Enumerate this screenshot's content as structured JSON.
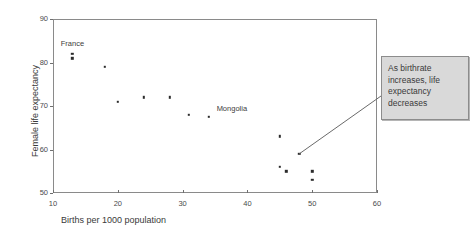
{
  "chart_data": {
    "type": "scatter",
    "title": "",
    "xlabel": "Births per 1000 population",
    "ylabel": "Female life expectancy",
    "xlim": [
      10,
      60
    ],
    "ylim": [
      50,
      90
    ],
    "xticks": [
      10,
      20,
      30,
      40,
      50,
      60
    ],
    "yticks": [
      50,
      60,
      70,
      80,
      90
    ],
    "grid": false,
    "legend": null,
    "series": [
      {
        "name": "countries",
        "points": [
          {
            "x": 13,
            "y": 82
          },
          {
            "x": 13,
            "y": 81
          },
          {
            "x": 18,
            "y": 79
          },
          {
            "x": 20,
            "y": 71
          },
          {
            "x": 24,
            "y": 72
          },
          {
            "x": 28,
            "y": 72
          },
          {
            "x": 31,
            "y": 68
          },
          {
            "x": 34,
            "y": 67.5
          },
          {
            "x": 45,
            "y": 63
          },
          {
            "x": 45,
            "y": 56
          },
          {
            "x": 46,
            "y": 55
          },
          {
            "x": 48,
            "y": 59
          },
          {
            "x": 50,
            "y": 55
          },
          {
            "x": 50,
            "y": 53
          }
        ]
      }
    ],
    "point_annotations": [
      {
        "text": "France",
        "x": 13,
        "y": 84.2
      },
      {
        "text": "Mongolia",
        "x": 37.6,
        "y": 69.2
      }
    ],
    "callout": {
      "text": "As birthrate increases, life expectancy decreases",
      "anchor_point": {
        "x": 48,
        "y": 59
      }
    },
    "colors": {
      "point": "#2b2b2b",
      "axis": "#8a8a8a",
      "text": "#3a3a3a",
      "callout_fill": "#d9d9d9",
      "callout_border": "#8c8c8c",
      "leader_line": "#6a6a6a"
    }
  }
}
